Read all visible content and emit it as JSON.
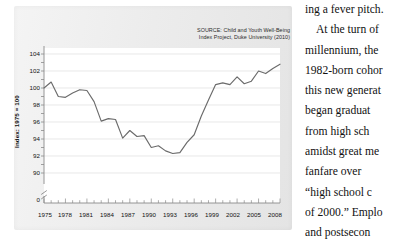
{
  "figure": {
    "source_note": "SOURCE: Child and Youth Well-Being\nIndex Project, Duke University (2010)",
    "y_axis_label": "Index: 1975 = 100",
    "axis_break_label": "0"
  },
  "chart_data": {
    "type": "line",
    "title": "",
    "subtitle": "",
    "source": "SOURCE: Child and Youth Well-Being Index Project, Duke University (2010)",
    "xlabel": "",
    "ylabel": "Index: 1975 = 100",
    "xlim": [
      1975,
      2008
    ],
    "ylim": [
      89,
      105
    ],
    "grid": true,
    "grid_axis": "y",
    "legend": false,
    "legend_position": "none",
    "axis_break": true,
    "axis_break_label": "0",
    "line_color": "#6b6b6b",
    "ytick_labels": [
      "104",
      "102",
      "100",
      "98",
      "96",
      "94",
      "92",
      "90"
    ],
    "yticks": [
      104,
      102,
      100,
      98,
      96,
      94,
      92,
      90
    ],
    "xtick_labels": [
      "1975",
      "1978",
      "1981",
      "1984",
      "1987",
      "1990",
      "1993",
      "1996",
      "1999",
      "2002",
      "2005",
      "2008"
    ],
    "xticks": [
      1975,
      1978,
      1981,
      1984,
      1987,
      1990,
      1993,
      1996,
      1999,
      2002,
      2005,
      2008
    ],
    "x": [
      1975,
      1976,
      1977,
      1978,
      1979,
      1980,
      1981,
      1982,
      1983,
      1984,
      1985,
      1986,
      1987,
      1988,
      1989,
      1990,
      1991,
      1992,
      1993,
      1994,
      1995,
      1996,
      1997,
      1998,
      1999,
      2000,
      2001,
      2002,
      2003,
      2004,
      2005,
      2006,
      2007,
      2008
    ],
    "series": [
      {
        "name": "Child and Youth Well-Being Index",
        "values": [
          100.0,
          100.7,
          99.0,
          98.9,
          99.4,
          99.8,
          99.7,
          98.4,
          96.1,
          96.4,
          96.3,
          94.1,
          95.0,
          94.3,
          94.4,
          93.0,
          93.2,
          92.6,
          92.3,
          92.4,
          93.6,
          94.5,
          96.7,
          98.6,
          100.4,
          100.6,
          100.4,
          101.3,
          100.5,
          100.8,
          102.0,
          101.7,
          102.3,
          102.8
        ]
      }
    ]
  },
  "body_text": {
    "lines": [
      "ing a fever pitch.",
      "At the turn of",
      "millennium, the",
      "1982-born cohor",
      "this new generat",
      "began  graduat",
      "from  high  sch",
      "amidst great me",
      "fanfare  over",
      "“high  school  c",
      "of 2000.” Emplo",
      "and  postsecon"
    ]
  }
}
